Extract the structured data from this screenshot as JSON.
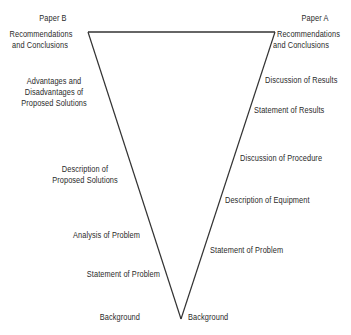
{
  "diagram": {
    "type": "inverted-triangle comparison",
    "line_color": "#333333",
    "left": {
      "heading": "Paper B",
      "labels": [
        "Recommendations\nand Conclusions",
        "Advantages and\nDisadvantages of\nProposed Solutions",
        "Description of\nProposed Solutions",
        "Analysis of Problem",
        "Statement of Problem",
        "Background"
      ]
    },
    "right": {
      "heading": "Paper A",
      "labels": [
        "Recommendations\nand Conclusions",
        "Discussion of Results",
        "Statement of Results",
        "Discussion of Procedure",
        "Description of Equipment",
        "Statement of Problem",
        "Background"
      ]
    }
  },
  "labels": {
    "paper_b": "Paper B",
    "paper_a": "Paper A",
    "b_rec_1": "Recommendations",
    "b_rec_2": "and Conclusions",
    "b_adv_1": "Advantages and",
    "b_adv_2": "Disadvantages of",
    "b_adv_3": "Proposed Solutions",
    "b_desc_1": "Description of",
    "b_desc_2": "Proposed Solutions",
    "b_analysis": "Analysis of Problem",
    "b_statement": "Statement of Problem",
    "b_background": "Background",
    "a_rec_1": "Recommendations",
    "a_rec_2": "and Conclusions",
    "a_disc_results": "Discussion of Results",
    "a_stmt_results": "Statement of Results",
    "a_disc_proc": "Discussion of Procedure",
    "a_desc_equip": "Description of Equipment",
    "a_statement": "Statement of Problem",
    "a_background": "Background"
  }
}
